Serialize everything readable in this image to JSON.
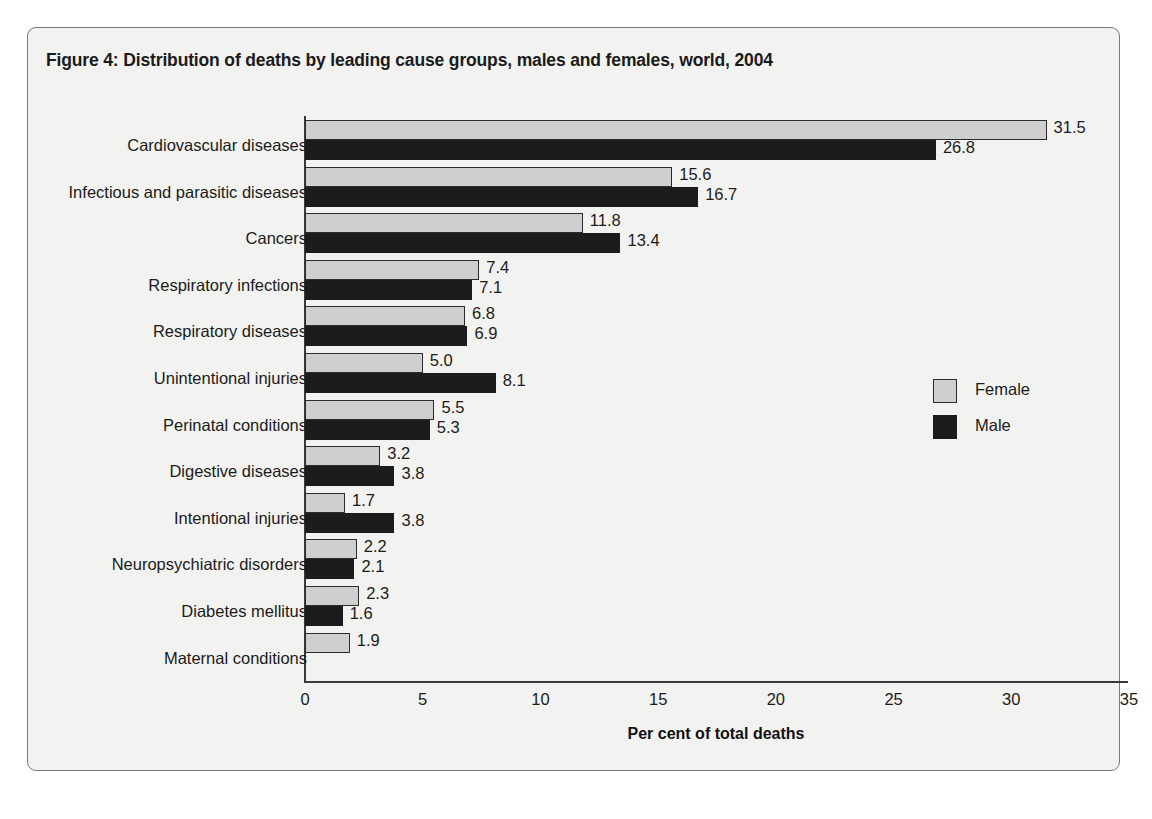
{
  "figure": {
    "title": "Figure 4: Distribution of deaths by leading cause groups, males and females, world, 2004",
    "background_color": "#f2f2f1",
    "border_color": "#7a7a7a"
  },
  "legend": {
    "position": "right",
    "entries": [
      {
        "label": "Female",
        "color": "#cfcfcf"
      },
      {
        "label": "Male",
        "color": "#1c1c1c"
      }
    ]
  },
  "chart_data": {
    "type": "bar",
    "orientation": "horizontal",
    "title": "Figure 4: Distribution of deaths by leading cause groups, males and females, world, 2004",
    "xlabel": "Per cent of total deaths",
    "ylabel": "",
    "xlim": [
      0,
      35
    ],
    "xticks": [
      "0",
      "5",
      "10",
      "15",
      "20",
      "25",
      "30",
      "35"
    ],
    "xtick_values": [
      0,
      5,
      10,
      15,
      20,
      25,
      30,
      35
    ],
    "grid": false,
    "legend_position": "right",
    "categories": [
      "Cardiovascular diseases",
      "Infectious and parasitic diseases",
      "Cancers",
      "Respiratory infections",
      "Respiratory diseases",
      "Unintentional injuries",
      "Perinatal conditions",
      "Digestive diseases",
      "Intentional injuries",
      "Neuropsychiatric disorders",
      "Diabetes mellitus",
      "Maternal conditions"
    ],
    "series": [
      {
        "name": "Female",
        "color": "#cfcfcf",
        "values": [
          31.5,
          15.6,
          11.8,
          7.4,
          6.8,
          5.0,
          5.5,
          3.2,
          1.7,
          2.2,
          2.3,
          1.9
        ],
        "labels": [
          "31.5",
          "15.6",
          "11.8",
          "7.4",
          "6.8",
          "5.0",
          "5.5",
          "3.2",
          "1.7",
          "2.2",
          "2.3",
          "1.9"
        ]
      },
      {
        "name": "Male",
        "color": "#1c1c1c",
        "values": [
          26.8,
          16.7,
          13.4,
          7.1,
          6.9,
          8.1,
          5.3,
          3.8,
          3.8,
          2.1,
          1.6,
          null
        ],
        "labels": [
          "26.8",
          "16.7",
          "13.4",
          "7.1",
          "6.9",
          "8.1",
          "5.3",
          "3.8",
          "3.8",
          "2.1",
          "1.6",
          null
        ]
      }
    ]
  }
}
